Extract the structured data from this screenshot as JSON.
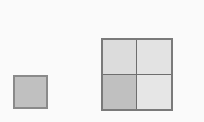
{
  "canvas": {
    "width": 204,
    "height": 122,
    "background_color": "#fafafa"
  },
  "palette": {
    "outline": "#7a7a7a",
    "divider": "#6e6e6e",
    "shaded_gray": "#c0c0c0",
    "light_gray": "#dcdcdc",
    "lighter_gray": "#e3e3e3",
    "lightest_gray": "#e6e6e6",
    "small_square_outline": "#8a8a8a"
  },
  "shapes": {
    "small_square": {
      "name": "small square",
      "fill": "#c0c0c0",
      "outline": "#8a8a8a",
      "x": 13,
      "y": 75,
      "width": 35,
      "height": 34
    },
    "large_square": {
      "name": "large square divided into four quadrants",
      "outline": "#7a7a7a",
      "divider": "#6e6e6e",
      "x": 101,
      "y": 38,
      "width": 72,
      "height": 73,
      "rows": 2,
      "columns": 2,
      "quadrants": [
        {
          "position": "top-left",
          "fill": "#dcdcdc",
          "shaded": false
        },
        {
          "position": "top-right",
          "fill": "#e3e3e3",
          "shaded": false
        },
        {
          "position": "bottom-left",
          "fill": "#c0c0c0",
          "shaded": true
        },
        {
          "position": "bottom-right",
          "fill": "#e6e6e6",
          "shaded": false
        }
      ]
    }
  }
}
